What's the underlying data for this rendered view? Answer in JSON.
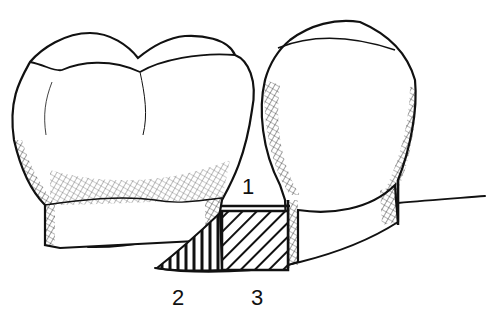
{
  "figure": {
    "labels": [
      {
        "id": "1",
        "text": "1",
        "region": "open interproximal space above contact-level line"
      },
      {
        "id": "2",
        "text": "2",
        "region": "vertical-hatched triangular area"
      },
      {
        "id": "3",
        "text": "3",
        "region": "diagonal-hatched rectangular area"
      }
    ],
    "colors": {
      "ink": "#111111",
      "background": "#ffffff"
    }
  }
}
